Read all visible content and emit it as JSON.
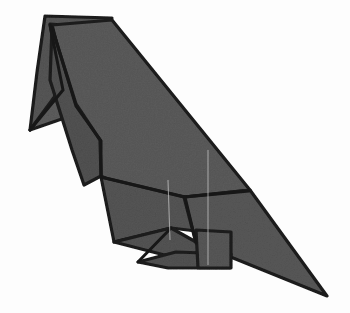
{
  "figure": {
    "subject_name": "folded paper bird",
    "alt_text": "A folded origami bird resembling a raven or crow, shown in profile facing left, rendered in textured gray paper with dark creased edges",
    "background_color": "#fdfdfd",
    "paper_fill_color": "#5a5a5a",
    "paper_fill_shadow_color": "#4e4e4e",
    "paper_fill_highlight_color": "#666666",
    "outline_color": "#1c1c1c",
    "soft_crease_color": "#cfcfcf",
    "canvas": {
      "width": 350,
      "height": 313
    }
  },
  "parts": [
    {
      "id": "head-upper-beak",
      "label": "upper beak",
      "fill": "#565656",
      "points": "45,16 112,18 96,74 60,96 30,130 37,72"
    },
    {
      "id": "head-lower-beak",
      "label": "lower beak wedge",
      "fill": "#5d5d5d",
      "points": "50,24 104,28 82,112 30,130 61,88"
    },
    {
      "id": "back-wing-upper",
      "label": "upper back and wing",
      "fill": "#5b5b5b",
      "points": "52,25 112,20 250,190 184,197 119,185 101,176 100,140 72,104"
    },
    {
      "id": "neck-breast",
      "label": "neck and breast",
      "fill": "#525252",
      "points": "52,28 76,104 100,140 101,176 84,185 72,150 50,80"
    },
    {
      "id": "wing-lower-flap",
      "label": "lower wing flap",
      "fill": "#555555",
      "points": "101,177 184,197 245,237 171,228 114,242"
    },
    {
      "id": "tail",
      "label": "tail",
      "fill": "#585858",
      "points": "250,190 327,296 196,243 184,197"
    },
    {
      "id": "foot-upper-claw",
      "label": "upper claw",
      "fill": "#545454",
      "points": "114,242 171,228 214,252 176,258"
    },
    {
      "id": "foot-lower-claw",
      "label": "lower claw",
      "fill": "#525252",
      "points": "138,262 176,252 231,254 230,268 168,268"
    },
    {
      "id": "leg-block",
      "label": "leg block",
      "fill": "#575757",
      "points": "196,230 231,232 231,268 198,268"
    }
  ],
  "creases": [
    {
      "id": "crease-neck-fold",
      "label": "neck fold",
      "d": "M52,27 L76,106 L101,141 L101,177",
      "type": "hard"
    },
    {
      "id": "crease-beak-inner",
      "label": "inner beak fold",
      "d": "M50,25 L63,90 L30,130",
      "type": "hard"
    },
    {
      "id": "crease-wing-seam",
      "label": "wing seam",
      "d": "M101,177 L185,197 L249,191",
      "type": "hard"
    },
    {
      "id": "crease-tail-seam",
      "label": "tail seam",
      "d": "M185,197 L196,243",
      "type": "hard"
    },
    {
      "id": "crease-claw-split",
      "label": "claw split",
      "d": "M171,228 L138,262",
      "type": "hard"
    },
    {
      "id": "crease-vertical-soft",
      "label": "vertical soft crease",
      "d": "M208,150 L208,265",
      "type": "soft"
    },
    {
      "id": "crease-wing-soft",
      "label": "wing soft crease",
      "d": "M168,180 L170,240",
      "type": "soft"
    }
  ]
}
